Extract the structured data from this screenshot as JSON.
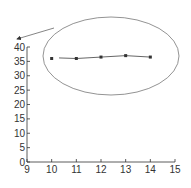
{
  "chart_data": {
    "type": "line",
    "title": "",
    "xlabel": "",
    "ylabel": "",
    "xlim": [
      9,
      15
    ],
    "ylim": [
      0,
      40
    ],
    "x_ticks": [
      "9",
      "10",
      "11",
      "12",
      "13",
      "14",
      "15"
    ],
    "y_ticks": [
      "0",
      "5",
      "10",
      "15",
      "20",
      "25",
      "30",
      "35",
      "40"
    ],
    "grid": false,
    "legend": null,
    "series": [
      {
        "name": "data",
        "x": [
          10,
          11,
          12,
          13,
          14
        ],
        "values": [
          36,
          36,
          36.5,
          37,
          36.5
        ]
      }
    ],
    "annotations": [
      {
        "type": "ellipse",
        "description": "ellipse enclosing data points"
      },
      {
        "type": "arrow",
        "description": "arrow pointing from ellipse toward top of y-axis"
      }
    ]
  },
  "colors": {
    "axis": "#333333",
    "line": "#555555",
    "marker": "#333333",
    "annotation": "#666666"
  }
}
